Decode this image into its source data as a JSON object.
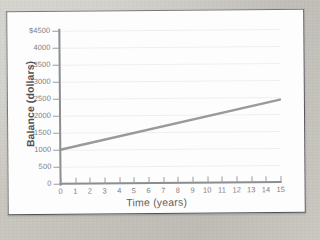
{
  "figure": {
    "panel_background": "#fdfdfd",
    "page_background": "#c6c4bd",
    "border_color": "#76777a"
  },
  "chart_data": {
    "type": "line",
    "title": "",
    "subtitle": "",
    "xlabel": "Time (years)",
    "ylabel": "Balance (dollars)",
    "xlim": [
      0,
      15
    ],
    "ylim": [
      0,
      4500
    ],
    "xticks": [
      0,
      1,
      2,
      3,
      4,
      5,
      6,
      7,
      8,
      9,
      10,
      11,
      12,
      13,
      14,
      15
    ],
    "xtick_labels": [
      "0",
      "1",
      "2",
      "3",
      "4",
      "5",
      "6",
      "7",
      "8",
      "9",
      "10",
      "11",
      "12",
      "13",
      "14",
      "15"
    ],
    "yticks": [
      0,
      500,
      1000,
      1500,
      2000,
      2500,
      3000,
      3500,
      4000,
      4500
    ],
    "ytick_labels": [
      "0",
      "500",
      "1000",
      "1500",
      "2000",
      "2500",
      "3000",
      "3500",
      "4000",
      "$4500"
    ],
    "grid": true,
    "grid_axis": "y",
    "grid_color": "#eeeff1",
    "legend": false,
    "legend_position": "none",
    "annotations": [],
    "series": [
      {
        "name": "Balance",
        "color": "#9a9a9a",
        "line_width": 2.4,
        "x": [
          0,
          15
        ],
        "values": [
          1000,
          2425
        ],
        "points": [
          {
            "x": 0,
            "y": 1000
          },
          {
            "x": 15,
            "y": 2425
          }
        ]
      }
    ]
  }
}
